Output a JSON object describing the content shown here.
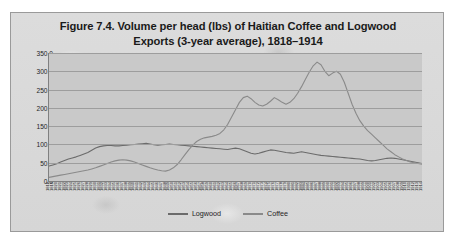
{
  "figure": {
    "title_line1": "Figure 7.4. Volume per head (lbs) of Haitian Coffee and Logwood",
    "title_line2": "Exports (3-year average), 1818–1914",
    "panel_background": "#d9d9d9",
    "plot_background": "#c9c9c9",
    "border_color": "#9a9a9a"
  },
  "legend": {
    "position": "bottom-center",
    "items": [
      {
        "label": "Logwood",
        "color": "#6b6b6b"
      },
      {
        "label": "Coffee",
        "color": "#8a8a8a"
      }
    ]
  },
  "chart_data": {
    "type": "line",
    "title": "Figure 7.4. Volume per head (lbs) of Haitian Coffee and Logwood Exports (3-year average), 1818–1914",
    "xlabel": "",
    "ylabel": "",
    "ylim": [
      0,
      350
    ],
    "ytick_step": 50,
    "ytick_labels": [
      "0.0",
      "50.0",
      "100.0",
      "150.0",
      "200.0",
      "250.0",
      "300.0",
      "350.0"
    ],
    "grid": true,
    "legend_position": "bottom",
    "x": [
      1818,
      1819,
      1820,
      1821,
      1822,
      1823,
      1824,
      1825,
      1826,
      1827,
      1828,
      1829,
      1830,
      1831,
      1832,
      1833,
      1834,
      1835,
      1836,
      1837,
      1838,
      1839,
      1840,
      1841,
      1842,
      1843,
      1844,
      1845,
      1846,
      1847,
      1848,
      1849,
      1850,
      1851,
      1852,
      1853,
      1854,
      1855,
      1856,
      1857,
      1858,
      1859,
      1860,
      1861,
      1862,
      1863,
      1864,
      1865,
      1866,
      1867,
      1868,
      1869,
      1870,
      1871,
      1872,
      1873,
      1874,
      1875,
      1876,
      1877,
      1878,
      1879,
      1880,
      1881,
      1882,
      1883,
      1884,
      1885,
      1886,
      1887,
      1888,
      1889,
      1890,
      1891,
      1892,
      1893,
      1894,
      1895,
      1896,
      1897,
      1898,
      1899,
      1900,
      1901,
      1902,
      1903,
      1904,
      1905,
      1906,
      1907,
      1908,
      1909,
      1910,
      1911,
      1912,
      1913,
      1914
    ],
    "xtick_labels": [
      "1818",
      "1819",
      "1820",
      "1821",
      "1822",
      "1823",
      "1824",
      "1825",
      "1826",
      "1827",
      "1828",
      "1829",
      "1830",
      "1831",
      "1832",
      "1833",
      "1834",
      "1835",
      "1836",
      "1837",
      "1838",
      "1839",
      "1840",
      "1841",
      "1842",
      "1843",
      "1844",
      "1845",
      "1846",
      "1847",
      "1848",
      "1849",
      "1850",
      "1851",
      "1852",
      "1853",
      "1854",
      "1855",
      "1856",
      "1857",
      "1858",
      "1859",
      "1860",
      "1861",
      "1862",
      "1863",
      "1864",
      "1865",
      "1866",
      "1867",
      "1868",
      "1869",
      "1870",
      "1871",
      "1872",
      "1873",
      "1874",
      "1875",
      "1876",
      "1877",
      "1878",
      "1879",
      "1880",
      "1881",
      "1882",
      "1883",
      "1884",
      "1885",
      "1886",
      "1887",
      "1888",
      "1889",
      "1890",
      "1891",
      "1892",
      "1893",
      "1894",
      "1895",
      "1896",
      "1897",
      "1898",
      "1899",
      "1900",
      "1901",
      "1902",
      "1903",
      "1904",
      "1905",
      "1906",
      "1907",
      "1908",
      "1909",
      "1910",
      "1911",
      "1912",
      "1913",
      "1914"
    ],
    "series": [
      {
        "name": "Logwood",
        "color": "#6b6b6b",
        "values": [
          41,
          44,
          47,
          52,
          56,
          60,
          63,
          66,
          70,
          74,
          78,
          84,
          90,
          94,
          96,
          97,
          97,
          96,
          96,
          97,
          98,
          99,
          100,
          101,
          102,
          103,
          101,
          99,
          98,
          99,
          100,
          101,
          100,
          99,
          98,
          97,
          96,
          95,
          94,
          93,
          92,
          91,
          90,
          89,
          88,
          87,
          86,
          88,
          90,
          88,
          84,
          80,
          76,
          74,
          76,
          79,
          82,
          85,
          84,
          82,
          80,
          78,
          77,
          76,
          78,
          80,
          78,
          76,
          74,
          72,
          70,
          69,
          68,
          67,
          66,
          65,
          64,
          63,
          62,
          61,
          60,
          58,
          56,
          55,
          56,
          58,
          60,
          62,
          63,
          62,
          60,
          58,
          56,
          54,
          52,
          50,
          48
        ]
      },
      {
        "name": "Coffee",
        "color": "#8a8a8a",
        "values": [
          10,
          12,
          14,
          16,
          18,
          20,
          22,
          24,
          26,
          28,
          30,
          33,
          36,
          40,
          44,
          48,
          52,
          55,
          57,
          58,
          57,
          55,
          52,
          48,
          44,
          40,
          36,
          33,
          30,
          28,
          27,
          30,
          36,
          45,
          58,
          72,
          86,
          98,
          108,
          114,
          118,
          120,
          122,
          125,
          130,
          140,
          155,
          175,
          195,
          215,
          228,
          232,
          225,
          215,
          208,
          205,
          210,
          218,
          228,
          222,
          215,
          210,
          215,
          225,
          240,
          258,
          278,
          298,
          315,
          325,
          318,
          300,
          288,
          295,
          300,
          292,
          270,
          240,
          210,
          185,
          165,
          150,
          138,
          128,
          118,
          108,
          98,
          88,
          80,
          72,
          66,
          60,
          56,
          52,
          50,
          48,
          46
        ]
      }
    ]
  }
}
